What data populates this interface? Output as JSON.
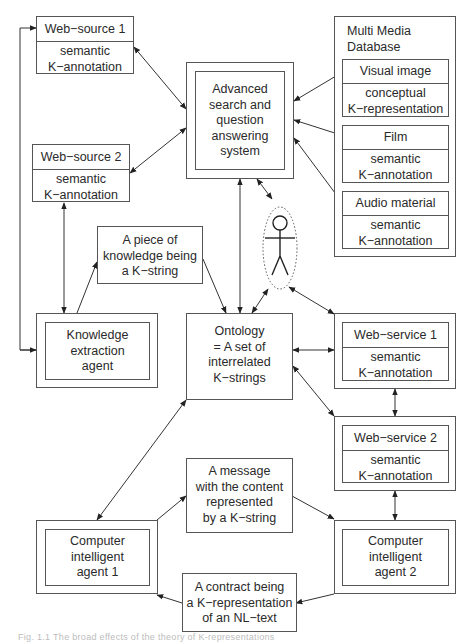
{
  "diagram": {
    "nodes": {
      "web_source_1": {
        "title": "Web−source 1",
        "body": "semantic\nK−annotation"
      },
      "web_source_2": {
        "title": "Web−source 2",
        "body": "semantic\nK−annotation"
      },
      "search_system": {
        "text": "Advanced\nsearch and\nquestion\nanswering\nsystem"
      },
      "multimedia_db": {
        "title": "Multi Media\nDatabase",
        "items": [
          {
            "title": "Visual image",
            "body": "conceptual\nK−representation"
          },
          {
            "title": "Film",
            "body": "semantic\nK−annotation"
          },
          {
            "title": "Audio material",
            "body": "semantic\nK−annotation"
          }
        ]
      },
      "user": {
        "icon": "stick-figure-user"
      },
      "knowledge_piece": {
        "text": "A piece of\nknowledge being\na K−string"
      },
      "knowledge_agent": {
        "text": "Knowledge\nextraction\nagent"
      },
      "ontology": {
        "text": "Ontology\n= A set of\ninterrelated\nK−strings"
      },
      "web_service_1": {
        "title": "Web−service 1",
        "body": "semantic\nK−annotation"
      },
      "web_service_2": {
        "title": "Web−service 2",
        "body": "semantic\nK−annotation"
      },
      "message": {
        "text": "A message\nwith the content\nrepresented\nby a K−string"
      },
      "agent_1": {
        "text": "Computer\nintelligent\nagent 1"
      },
      "agent_2": {
        "text": "Computer\nintelligent\nagent 2"
      },
      "contract": {
        "text": "A contract being\na K−representation\nof an NL−text"
      }
    },
    "edges": [
      {
        "from": "web_source_1",
        "to": "search_system",
        "type": "bidirectional"
      },
      {
        "from": "web_source_2",
        "to": "search_system",
        "type": "bidirectional"
      },
      {
        "from": "search_system",
        "to": "visual_image",
        "type": "bidirectional"
      },
      {
        "from": "search_system",
        "to": "film",
        "type": "bidirectional"
      },
      {
        "from": "search_system",
        "to": "audio_material",
        "type": "bidirectional"
      },
      {
        "from": "search_system",
        "to": "user",
        "type": "bidirectional"
      },
      {
        "from": "search_system",
        "to": "ontology",
        "type": "bidirectional"
      },
      {
        "from": "web_source_2",
        "to": "knowledge_agent",
        "type": "bidirectional"
      },
      {
        "from": "knowledge_agent",
        "to": "web_source_1",
        "type": "directed-loop"
      },
      {
        "from": "knowledge_agent",
        "to": "knowledge_piece",
        "type": "directed"
      },
      {
        "from": "knowledge_piece",
        "to": "ontology",
        "type": "directed"
      },
      {
        "from": "user",
        "to": "ontology",
        "type": "bidirectional"
      },
      {
        "from": "user",
        "to": "web_service_1",
        "type": "bidirectional"
      },
      {
        "from": "ontology",
        "to": "web_service_1",
        "type": "bidirectional"
      },
      {
        "from": "ontology",
        "to": "web_service_2",
        "type": "bidirectional"
      },
      {
        "from": "web_service_1",
        "to": "web_service_2",
        "type": "bidirectional"
      },
      {
        "from": "web_service_2",
        "to": "agent_2",
        "type": "bidirectional"
      },
      {
        "from": "ontology",
        "to": "agent_1",
        "type": "bidirectional"
      },
      {
        "from": "agent_1",
        "to": "message",
        "type": "directed"
      },
      {
        "from": "message",
        "to": "agent_2",
        "type": "directed"
      },
      {
        "from": "agent_2",
        "to": "contract",
        "type": "directed"
      },
      {
        "from": "contract",
        "to": "agent_1",
        "type": "directed"
      }
    ]
  },
  "caption": "Fig. 1.1 The broad effects of the theory of K-representations"
}
